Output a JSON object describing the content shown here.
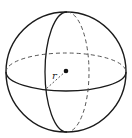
{
  "diagram": {
    "type": "sphere",
    "labels": {
      "radius": "r"
    },
    "colors": {
      "stroke": "#1a1a1a",
      "dashed": "#555555",
      "background": "#ffffff"
    }
  }
}
